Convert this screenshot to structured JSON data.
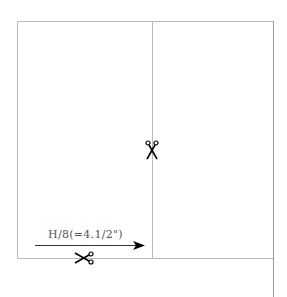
{
  "diagram": {
    "type": "sewing-pattern-cut-layout",
    "measurement_label": "H/8(=4.1/2\")",
    "icons": {
      "vertical_cut": "scissors-icon",
      "horizontal_cut": "scissors-icon",
      "arrow": "arrow-right-icon"
    },
    "colors": {
      "line": "#b8b8b8",
      "text": "#555555",
      "icon": "#000000"
    }
  }
}
